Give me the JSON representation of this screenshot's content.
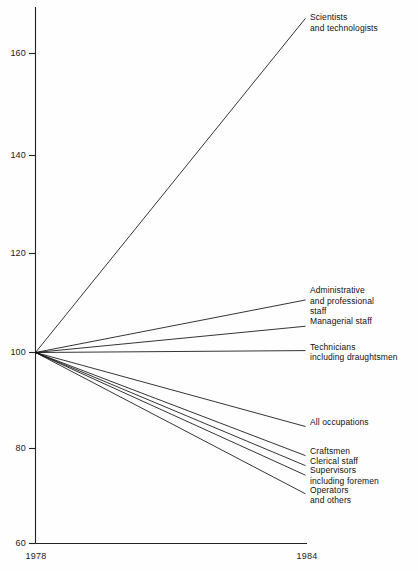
{
  "chart_data": {
    "type": "line",
    "title": "",
    "xlabel": "",
    "ylabel": "",
    "x": [
      1978,
      1984
    ],
    "xtick_labels": [
      "1978",
      "1984"
    ],
    "ylim": [
      60,
      170
    ],
    "yticks": [
      60,
      80,
      100,
      120,
      140,
      160
    ],
    "ytick_labels": [
      "60",
      "80",
      "100",
      "120",
      "140",
      "160"
    ],
    "grid": false,
    "legend_position": "right-inline-labels",
    "note": "All series indexed to 100 in 1978",
    "series": [
      {
        "name": "Scientists and technologists",
        "label_lines": [
          "Scientists",
          "and technologists"
        ],
        "values": [
          100,
          170
        ]
      },
      {
        "name": "Administrative and professional staff",
        "label_lines": [
          "Administrative",
          "and professional",
          "staff"
        ],
        "values": [
          100,
          111
        ]
      },
      {
        "name": "Managerial staff",
        "label_lines": [
          "Managerial staff"
        ],
        "values": [
          100,
          105.5
        ]
      },
      {
        "name": "Technicians including draughtsmen",
        "label_lines": [
          "Technicians",
          "including draughtsmen"
        ],
        "values": [
          100,
          100.4
        ]
      },
      {
        "name": "All occupations",
        "label_lines": [
          "All occupations"
        ],
        "values": [
          100,
          84.5
        ]
      },
      {
        "name": "Craftsmen",
        "label_lines": [
          "Craftsmen"
        ],
        "values": [
          100,
          78.4
        ]
      },
      {
        "name": "Clerical staff",
        "label_lines": [
          "Clerical staff"
        ],
        "values": [
          100,
          76.3
        ]
      },
      {
        "name": "Supervisors including foremen",
        "label_lines": [
          "Supervisors",
          "including foremen"
        ],
        "values": [
          100,
          74.3
        ]
      },
      {
        "name": "Operators and others",
        "label_lines": [
          "Operators",
          "and others"
        ],
        "values": [
          100,
          70.4
        ]
      }
    ]
  }
}
